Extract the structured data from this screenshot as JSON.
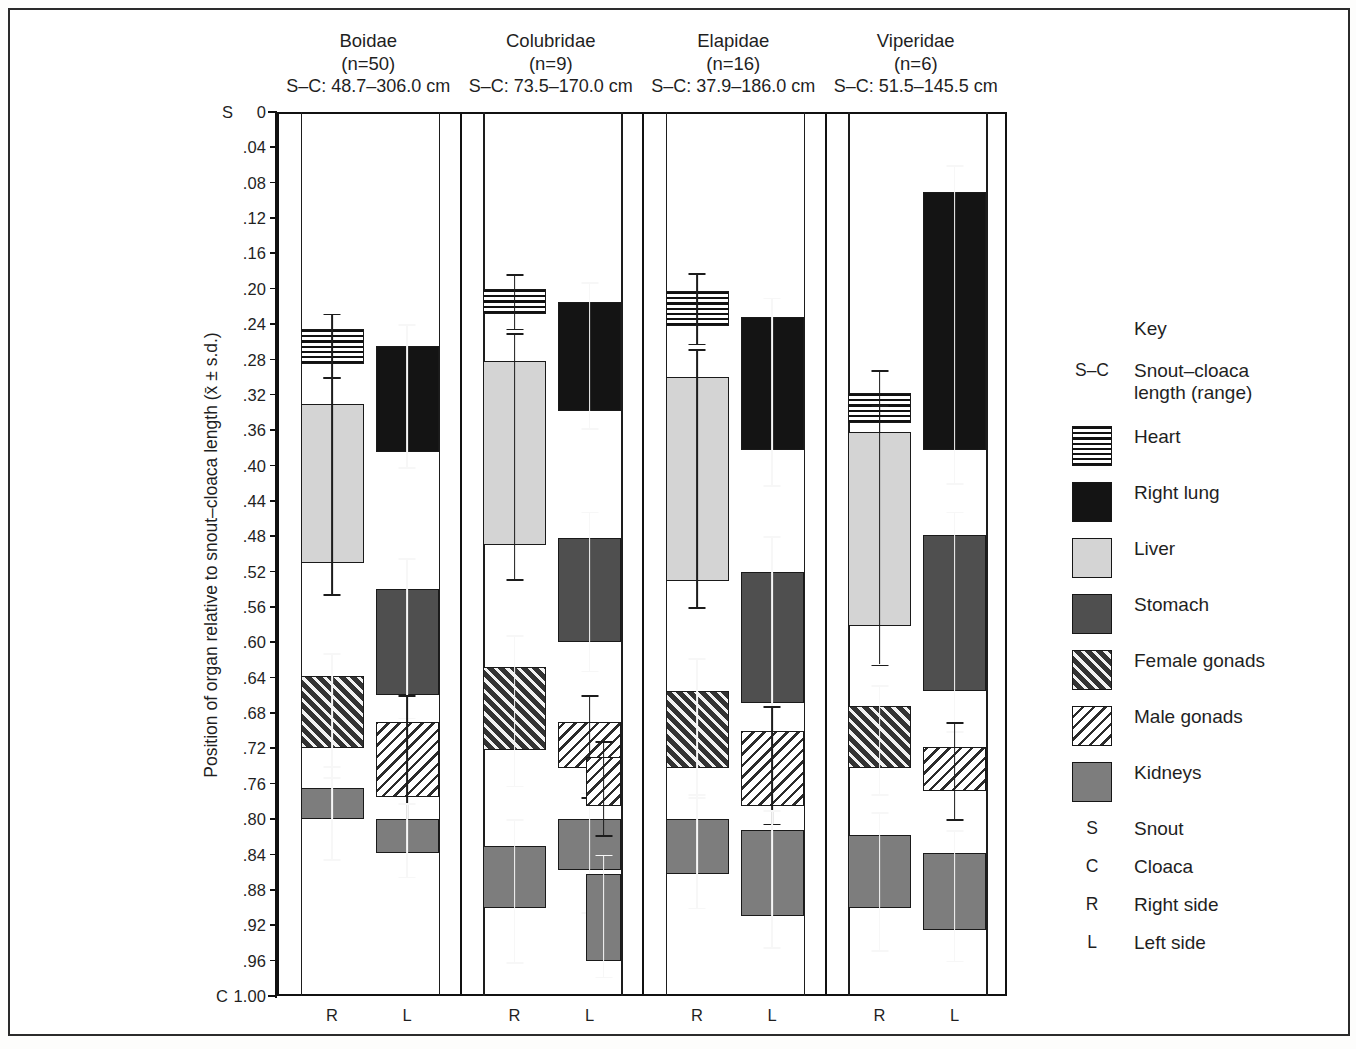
{
  "chart_data": {
    "type": "bar",
    "title": "",
    "xlabel": "",
    "ylabel": "Position of organ relative to snout–cloaca length (x̄ ± s.d.)",
    "ylim": [
      0,
      1.0
    ],
    "y_inverted": true,
    "grid": false,
    "legend_position": "right",
    "y_ticks": [
      "0",
      ".04",
      ".08",
      ".12",
      ".16",
      ".20",
      ".24",
      ".28",
      ".32",
      ".36",
      ".40",
      ".44",
      ".48",
      ".52",
      ".56",
      ".60",
      ".64",
      ".68",
      ".72",
      ".76",
      ".80",
      ".84",
      ".88",
      ".92",
      ".96",
      "1.00"
    ],
    "y_axis_endcap_top": "S",
    "y_axis_endcap_bottom": "C",
    "categories": [
      "Boidae",
      "Colubridae",
      "Elapidae",
      "Viperidae"
    ],
    "side_labels": [
      "R",
      "L"
    ],
    "groups": [
      {
        "name": "Boidae",
        "n_label": "(n=50)",
        "sc_label": "S–C: 48.7–306.0 cm",
        "sides": [
          {
            "side": "R",
            "organs": [
              {
                "organ": "Heart",
                "start": 0.245,
                "end": 0.285,
                "sd_top": 0.228,
                "sd_bottom": 0.3
              },
              {
                "organ": "Liver",
                "start": 0.33,
                "end": 0.51,
                "sd_top": 0.3,
                "sd_bottom": 0.545
              },
              {
                "organ": "Female gonads",
                "start": 0.638,
                "end": 0.72,
                "sd_top": 0.612,
                "sd_bottom": 0.752
              },
              {
                "organ": "Kidneys",
                "start": 0.765,
                "end": 0.8,
                "sd_top": 0.74,
                "sd_bottom": 0.845
              }
            ]
          },
          {
            "side": "L",
            "organs": [
              {
                "organ": "Right lung",
                "start": 0.265,
                "end": 0.385,
                "sd_top": 0.24,
                "sd_bottom": 0.402
              },
              {
                "organ": "Stomach",
                "start": 0.54,
                "end": 0.66,
                "sd_top": 0.505,
                "sd_bottom": 0.685
              },
              {
                "organ": "Male gonads",
                "start": 0.69,
                "end": 0.775,
                "sd_top": 0.66,
                "sd_bottom": 0.8
              },
              {
                "organ": "Kidneys",
                "start": 0.8,
                "end": 0.838,
                "sd_top": 0.782,
                "sd_bottom": 0.865
              }
            ]
          }
        ]
      },
      {
        "name": "Colubridae",
        "n_label": "(n=9)",
        "sc_label": "S–C: 73.5–170.0 cm",
        "sides": [
          {
            "side": "R",
            "organs": [
              {
                "organ": "Heart",
                "start": 0.2,
                "end": 0.228,
                "sd_top": 0.183,
                "sd_bottom": 0.245
              },
              {
                "organ": "Liver",
                "start": 0.282,
                "end": 0.49,
                "sd_top": 0.25,
                "sd_bottom": 0.528
              },
              {
                "organ": "Female gonads",
                "start": 0.628,
                "end": 0.722,
                "sd_top": 0.592,
                "sd_bottom": 0.762
              },
              {
                "organ": "Kidneys",
                "start": 0.83,
                "end": 0.9,
                "sd_top": 0.8,
                "sd_bottom": 0.962
              }
            ]
          },
          {
            "side": "L",
            "organs": [
              {
                "organ": "Right lung",
                "start": 0.215,
                "end": 0.338,
                "sd_top": 0.192,
                "sd_bottom": 0.358
              },
              {
                "organ": "Stomach",
                "start": 0.482,
                "end": 0.6,
                "sd_top": 0.452,
                "sd_bottom": 0.632
              },
              {
                "organ": "Male gonads",
                "start": 0.69,
                "end": 0.742,
                "sd_top": 0.66,
                "sd_bottom": 0.775
              },
              {
                "organ": "Kidneys",
                "start": 0.8,
                "end": 0.858,
                "sd_top": 0.77,
                "sd_bottom": 0.905
              },
              {
                "organ": "Male gonads 2",
                "start": 0.73,
                "end": 0.785,
                "sd_top": 0.712,
                "sd_bottom": 0.818
              },
              {
                "organ": "Kidneys 2",
                "start": 0.862,
                "end": 0.96,
                "sd_top": 0.84,
                "sd_bottom": 0.978
              }
            ]
          }
        ]
      },
      {
        "name": "Elapidae",
        "n_label": "(n=16)",
        "sc_label": "S–C: 37.9–186.0 cm",
        "sides": [
          {
            "side": "R",
            "organs": [
              {
                "organ": "Heart",
                "start": 0.202,
                "end": 0.242,
                "sd_top": 0.182,
                "sd_bottom": 0.262
              },
              {
                "organ": "Liver",
                "start": 0.3,
                "end": 0.53,
                "sd_top": 0.268,
                "sd_bottom": 0.56
              },
              {
                "organ": "Female gonads",
                "start": 0.655,
                "end": 0.742,
                "sd_top": 0.618,
                "sd_bottom": 0.775
              },
              {
                "organ": "Kidneys",
                "start": 0.8,
                "end": 0.862,
                "sd_top": 0.772,
                "sd_bottom": 0.9
              }
            ]
          },
          {
            "side": "L",
            "organs": [
              {
                "organ": "Right lung",
                "start": 0.232,
                "end": 0.382,
                "sd_top": 0.21,
                "sd_bottom": 0.422
              },
              {
                "organ": "Stomach",
                "start": 0.52,
                "end": 0.668,
                "sd_top": 0.48,
                "sd_bottom": 0.7
              },
              {
                "organ": "Male gonads",
                "start": 0.7,
                "end": 0.785,
                "sd_top": 0.672,
                "sd_bottom": 0.805
              },
              {
                "organ": "Kidneys",
                "start": 0.812,
                "end": 0.91,
                "sd_top": 0.79,
                "sd_bottom": 0.945
              }
            ]
          }
        ]
      },
      {
        "name": "Viperidae",
        "n_label": "(n=6)",
        "sc_label": "S–C: 51.5–145.5 cm",
        "sides": [
          {
            "side": "R",
            "organs": [
              {
                "organ": "Heart",
                "start": 0.318,
                "end": 0.352,
                "sd_top": 0.292,
                "sd_bottom": 0.378
              },
              {
                "organ": "Liver",
                "start": 0.362,
                "end": 0.582,
                "sd_top": 0.332,
                "sd_bottom": 0.625
              },
              {
                "organ": "Female gonads",
                "start": 0.672,
                "end": 0.742,
                "sd_top": 0.648,
                "sd_bottom": 0.772
              },
              {
                "organ": "Kidneys",
                "start": 0.818,
                "end": 0.9,
                "sd_top": 0.792,
                "sd_bottom": 0.948
              }
            ]
          },
          {
            "side": "L",
            "organs": [
              {
                "organ": "Right lung",
                "start": 0.09,
                "end": 0.382,
                "sd_top": 0.06,
                "sd_bottom": 0.42
              },
              {
                "organ": "Stomach",
                "start": 0.478,
                "end": 0.655,
                "sd_top": 0.452,
                "sd_bottom": 0.7
              },
              {
                "organ": "Male gonads",
                "start": 0.718,
                "end": 0.768,
                "sd_top": 0.69,
                "sd_bottom": 0.8
              },
              {
                "organ": "Kidneys",
                "start": 0.838,
                "end": 0.925,
                "sd_top": 0.812,
                "sd_bottom": 0.96
              }
            ]
          }
        ]
      }
    ]
  },
  "key": {
    "title": "Key",
    "entries": [
      {
        "glyph": "S–C",
        "type": "text",
        "label": "Snout–cloaca\nlength (range)"
      },
      {
        "glyph": "",
        "type": "swatch",
        "swatch": "heart",
        "label": "Heart"
      },
      {
        "glyph": "",
        "type": "swatch",
        "swatch": "rlung",
        "label": "Right lung"
      },
      {
        "glyph": "",
        "type": "swatch",
        "swatch": "liver",
        "label": "Liver"
      },
      {
        "glyph": "",
        "type": "swatch",
        "swatch": "stomach",
        "label": "Stomach"
      },
      {
        "glyph": "",
        "type": "swatch",
        "swatch": "fgonad",
        "label": "Female gonads"
      },
      {
        "glyph": "",
        "type": "swatch",
        "swatch": "mgonad",
        "label": "Male gonads"
      },
      {
        "glyph": "",
        "type": "swatch",
        "swatch": "kidney",
        "label": "Kidneys"
      },
      {
        "glyph": "S",
        "type": "text",
        "label": "Snout"
      },
      {
        "glyph": "C",
        "type": "text",
        "label": "Cloaca"
      },
      {
        "glyph": "R",
        "type": "text",
        "label": "Right side"
      },
      {
        "glyph": "L",
        "type": "text",
        "label": "Left side"
      }
    ]
  },
  "colors": {
    "heart": "#ffffff",
    "right_lung": "#141414",
    "liver": "#d4d4d4",
    "stomach": "#4f4f4f",
    "female_gonads": "#3a3a3a",
    "male_gonads": "#ffffff",
    "kidneys": "#7d7d7d",
    "axis": "#111111"
  }
}
